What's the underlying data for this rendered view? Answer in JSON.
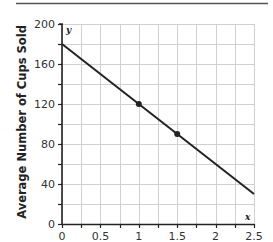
{
  "chart_data": {
    "type": "line",
    "title": "",
    "xlabel": "",
    "ylabel": "Average Number of Cups Sold",
    "x_axis_variable": "x",
    "y_axis_variable": "y",
    "xlim": [
      0,
      2.5
    ],
    "ylim": [
      0,
      200
    ],
    "x_ticks": [
      0,
      0.5,
      1,
      1.5,
      2,
      2.5
    ],
    "x_tick_labels": [
      "0",
      "0.5",
      "1",
      "1.5",
      "2",
      "2.5"
    ],
    "x_minor_step": 0.25,
    "y_ticks": [
      0,
      40,
      80,
      120,
      160,
      200
    ],
    "y_tick_labels": [
      "0",
      "40",
      "80",
      "120",
      "160",
      "200"
    ],
    "y_minor_step": 20,
    "grid": true,
    "legend": null,
    "series": [
      {
        "name": "line",
        "x": [
          0,
          2.5
        ],
        "y": [
          180,
          30
        ],
        "color": "#222222"
      }
    ],
    "points": [
      {
        "x": 1,
        "y": 120
      },
      {
        "x": 1.5,
        "y": 90
      }
    ]
  },
  "colors": {
    "grid": "#d0d0d0",
    "axis": "#222222",
    "line": "#222222",
    "rule": "#555555"
  }
}
